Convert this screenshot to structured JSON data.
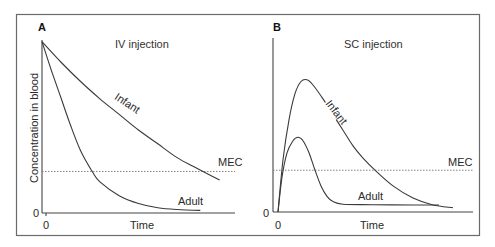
{
  "chart_data": [
    {
      "type": "line",
      "panel": "A",
      "title": "IV injection",
      "xlabel": "Time",
      "ylabel": "Concentration in blood",
      "x_tick_labels": [
        "0"
      ],
      "y_tick_labels": [
        "0"
      ],
      "xlim": [
        0,
        10
      ],
      "ylim": [
        0,
        10
      ],
      "grid": false,
      "reference_line": {
        "label": "MEC",
        "y": 2.4,
        "style": "dotted"
      },
      "series": [
        {
          "name": "Infant",
          "x": [
            0,
            1,
            2,
            3,
            4,
            5,
            6,
            7,
            8,
            9.2
          ],
          "y": [
            9.9,
            8.7,
            7.6,
            6.6,
            5.7,
            4.8,
            4.0,
            3.2,
            2.6,
            1.9
          ]
        },
        {
          "name": "Adult",
          "x": [
            0,
            0.5,
            1,
            1.5,
            2,
            2.6,
            3,
            4,
            5,
            6,
            7,
            8.2
          ],
          "y": [
            9.9,
            8.2,
            6.6,
            5.0,
            3.6,
            2.4,
            1.8,
            1.0,
            0.55,
            0.3,
            0.2,
            0.15
          ]
        }
      ]
    },
    {
      "type": "line",
      "panel": "B",
      "title": "SC injection",
      "xlabel": "Time",
      "ylabel": "",
      "x_tick_labels": [
        "0"
      ],
      "y_tick_labels": [
        "0"
      ],
      "xlim": [
        0,
        10
      ],
      "ylim": [
        0,
        10
      ],
      "grid": false,
      "reference_line": {
        "label": "MEC",
        "y": 2.4,
        "style": "dotted"
      },
      "series": [
        {
          "name": "Infant",
          "x": [
            0.25,
            0.5,
            0.8,
            1.1,
            1.4,
            1.7,
            2.0,
            2.5,
            3.0,
            3.5,
            4.0,
            4.5,
            5.1,
            6.0,
            7.0,
            8.0,
            9.0
          ],
          "y": [
            0,
            3.0,
            5.3,
            6.8,
            7.5,
            7.6,
            7.3,
            6.5,
            5.6,
            4.7,
            3.8,
            3.1,
            2.4,
            1.5,
            0.8,
            0.4,
            0.25
          ]
        },
        {
          "name": "Adult",
          "x": [
            0.25,
            0.45,
            0.7,
            1.0,
            1.25,
            1.5,
            1.8,
            2.1,
            2.4,
            2.7,
            3.0,
            3.5,
            5.0,
            7.0,
            8.3
          ],
          "y": [
            0,
            2.0,
            3.4,
            4.1,
            4.3,
            4.1,
            3.4,
            2.4,
            1.5,
            0.9,
            0.6,
            0.45,
            0.42,
            0.4,
            0.4
          ]
        }
      ]
    }
  ],
  "labels": {
    "panel_a": "A",
    "panel_b": "B",
    "title_a": "IV injection",
    "title_b": "SC injection",
    "ylabel": "Concentration in blood",
    "xlabel_a": "Time",
    "xlabel_b": "Time",
    "mec_a": "MEC",
    "mec_b": "MEC",
    "infant_a": "Infant",
    "adult_a": "Adult",
    "infant_b": "Infant",
    "adult_b": "Adult",
    "zero": "0"
  }
}
